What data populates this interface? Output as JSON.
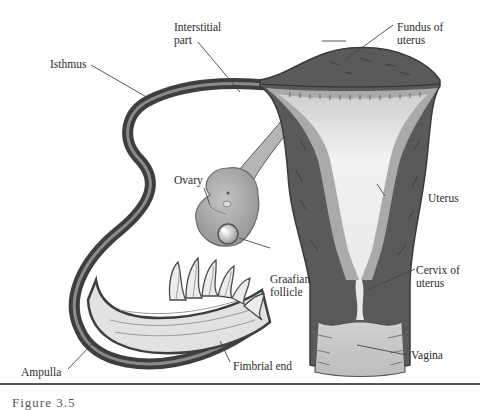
{
  "diagram": {
    "labels": {
      "interstitial": "Interstitial part",
      "interstitial_line1": "Interstitial",
      "interstitial_line2": "part",
      "fundus_line1": "Fundus of",
      "fundus_line2": "uterus",
      "isthmus": "Isthmus",
      "ovary": "Ovary",
      "uterus": "Uterus",
      "graafian_line1": "Graafian",
      "graafian_line2": "follicle",
      "cervix_line1": "Cervix of",
      "cervix_line2": "uterus",
      "fimbrial": "Fimbrial end",
      "ampulla": "Ampulla",
      "vagina": "Vagina"
    },
    "caption": "Figure 3.5"
  },
  "colors": {
    "muscle": "#5a5a5a",
    "muscle_dark": "#3e3e3e",
    "lining": "#a9a9a9",
    "cavity": "#e6e6e6",
    "ovary": "#9e9e9e",
    "tube_inner": "#d8d8d8",
    "leader": "#444444"
  }
}
